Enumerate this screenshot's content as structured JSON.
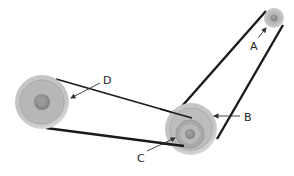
{
  "diagram": {
    "type": "belt-and-pulley system",
    "labels": {
      "a": "A",
      "b": "B",
      "c": "C",
      "d": "D"
    },
    "pulleys": [
      {
        "id": "A",
        "description": "small pulley, upper right"
      },
      {
        "id": "B",
        "description": "large outer pulley, lower middle"
      },
      {
        "id": "C",
        "description": "small inner pulley on same shaft as B"
      },
      {
        "id": "D",
        "description": "large pulley, left"
      }
    ],
    "belts": [
      {
        "connects": [
          "A",
          "B"
        ]
      },
      {
        "connects": [
          "C",
          "D"
        ]
      }
    ],
    "colors": {
      "belt": "#1a1a1a",
      "pulley_outer": "#c8c8c8",
      "pulley_face": "#b0b0b0",
      "hub": "#8f8f8f",
      "arrow": "#333333"
    }
  }
}
